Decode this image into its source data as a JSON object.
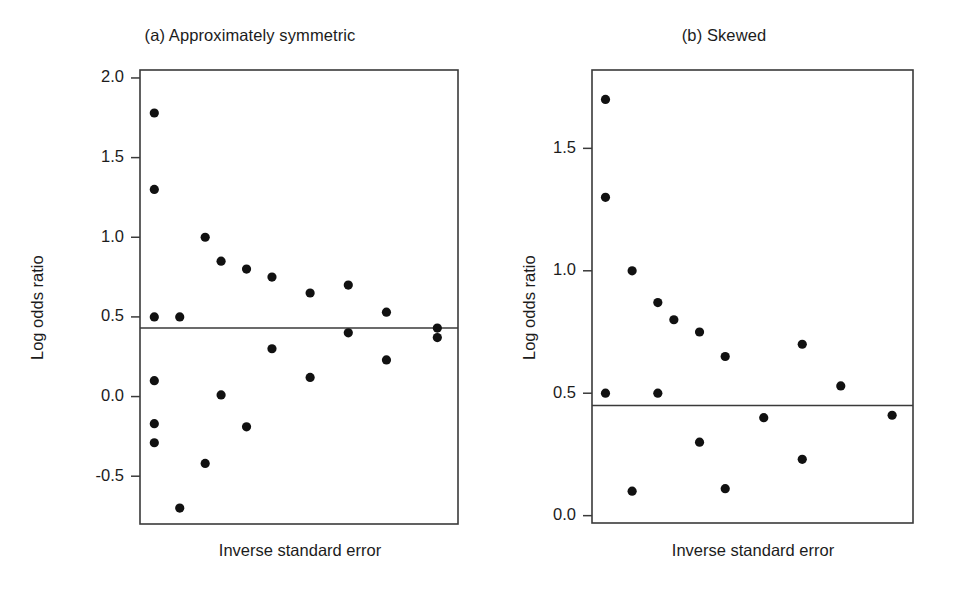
{
  "figure": {
    "background_color": "#ffffff",
    "ink_color": "#111111",
    "frame_color": "#3a3a3a"
  },
  "chart_data": [
    {
      "type": "scatter",
      "panel_label": "(a)",
      "title": "(a) Approximately symmetric",
      "xlabel": "Inverse standard error",
      "ylabel": "Log odds ratio",
      "xlim": [
        0,
        10
      ],
      "ylim": [
        -0.8,
        2.05
      ],
      "grid": false,
      "legend": "none",
      "xticks": [],
      "xticklabels": [],
      "yticks": [
        -0.5,
        0.0,
        0.5,
        1.0,
        1.5,
        2.0
      ],
      "yticklabels": [
        "-0.5",
        "0.0",
        "0.5",
        "1.0",
        "1.5",
        "2.0"
      ],
      "reference_line": {
        "orientation": "horizontal",
        "value": 0.43,
        "label": "pooled log odds ratio"
      },
      "x": [
        0.45,
        0.45,
        0.45,
        0.45,
        0.45,
        0.45,
        1.25,
        1.25,
        2.05,
        2.05,
        2.55,
        2.55,
        3.35,
        3.35,
        4.15,
        4.15,
        5.35,
        5.35,
        6.55,
        6.55,
        7.75,
        7.75,
        9.35,
        9.35
      ],
      "y": [
        1.78,
        1.3,
        0.5,
        0.1,
        -0.17,
        -0.29,
        -0.7,
        0.5,
        1.0,
        -0.42,
        0.85,
        0.01,
        0.8,
        -0.19,
        0.75,
        0.3,
        0.65,
        0.12,
        0.7,
        0.4,
        0.53,
        0.23,
        0.43,
        0.37
      ],
      "n_points": 24,
      "marker": "filled-circle"
    },
    {
      "type": "scatter",
      "panel_label": "(b)",
      "title": "(b) Skewed",
      "xlabel": "Inverse standard error",
      "ylabel": "Log odds ratio",
      "xlim": [
        0,
        10
      ],
      "ylim": [
        -0.03,
        1.82
      ],
      "grid": false,
      "legend": "none",
      "xticks": [],
      "xticklabels": [],
      "yticks": [
        0.0,
        0.5,
        1.0,
        1.5
      ],
      "yticklabels": [
        "0.0",
        "0.5",
        "1.0",
        "1.5"
      ],
      "reference_line": {
        "orientation": "horizontal",
        "value": 0.45,
        "label": "pooled log odds ratio"
      },
      "x": [
        0.42,
        0.42,
        0.42,
        1.25,
        1.25,
        2.05,
        2.05,
        2.55,
        3.35,
        3.35,
        4.15,
        4.15,
        5.35,
        6.55,
        6.55,
        7.75,
        9.35
      ],
      "y": [
        1.7,
        1.3,
        0.5,
        1.0,
        0.1,
        0.87,
        0.5,
        0.8,
        0.75,
        0.3,
        0.65,
        0.11,
        0.4,
        0.7,
        0.23,
        0.53,
        0.41
      ],
      "n_points": 17,
      "marker": "filled-circle"
    }
  ]
}
